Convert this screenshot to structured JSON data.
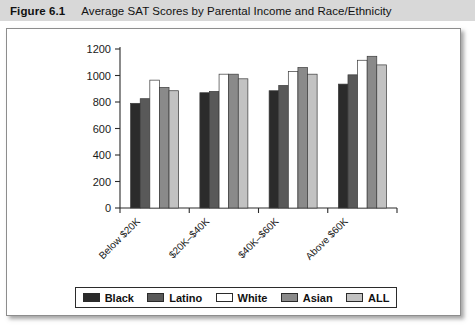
{
  "caption": {
    "figure_number": "Figure 6.1",
    "title": "Average SAT Scores by Parental Income and Race/Ethnicity"
  },
  "legend": {
    "position": "bottom",
    "items": [
      {
        "label": "Black",
        "color": "#2b2b2b"
      },
      {
        "label": "Latino",
        "color": "#595959"
      },
      {
        "label": "White",
        "color": "#ffffff"
      },
      {
        "label": "Asian",
        "color": "#8a8a8a"
      },
      {
        "label": "ALL",
        "color": "#c2c2c2"
      }
    ]
  },
  "chart_data": {
    "type": "bar",
    "title": "Average SAT Scores by Parental Income and Race/Ethnicity",
    "xlabel": "",
    "ylabel": "",
    "grid": false,
    "ylim": [
      0,
      1200
    ],
    "yticks": [
      0,
      200,
      400,
      600,
      800,
      1000,
      1200
    ],
    "ytick_labels": [
      "0",
      "200",
      "400",
      "600",
      "800",
      "1000",
      "1200"
    ],
    "categories": [
      "Below $20K",
      "$20K–$40K",
      "$40K–$60K",
      "Above $60K"
    ],
    "series": [
      {
        "name": "Black",
        "color": "#2b2b2b",
        "values": [
          790,
          870,
          885,
          935
        ]
      },
      {
        "name": "Latino",
        "color": "#595959",
        "values": [
          825,
          880,
          925,
          1005
        ]
      },
      {
        "name": "White",
        "color": "#ffffff",
        "values": [
          965,
          1010,
          1030,
          1115
        ]
      },
      {
        "name": "Asian",
        "color": "#8a8a8a",
        "values": [
          910,
          1010,
          1060,
          1145
        ]
      },
      {
        "name": "ALL",
        "color": "#c2c2c2",
        "values": [
          885,
          975,
          1010,
          1080
        ]
      }
    ]
  }
}
